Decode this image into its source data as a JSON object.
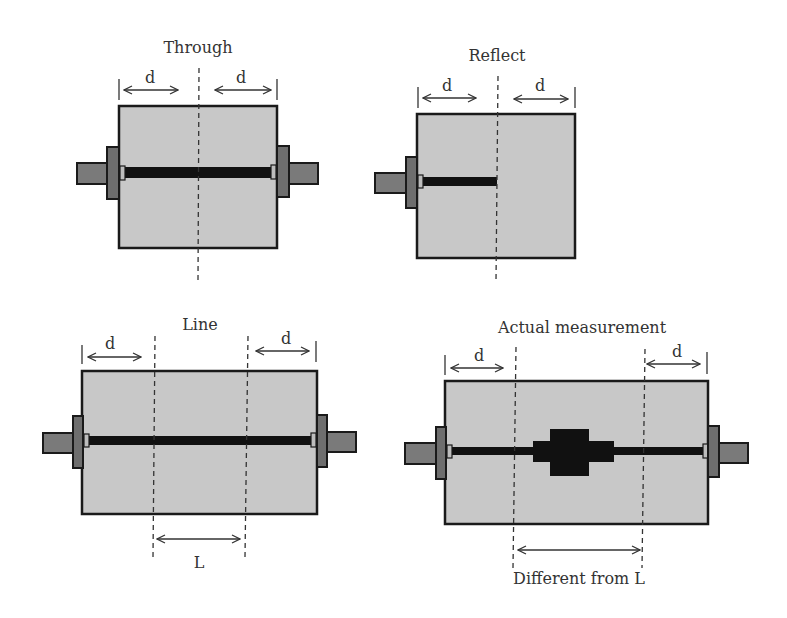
{
  "diagram": {
    "panels": {
      "through": {
        "title": "Through",
        "left_dim": "d",
        "right_dim": "d"
      },
      "reflect": {
        "title": "Reflect",
        "left_dim": "d",
        "right_dim": "d"
      },
      "line": {
        "title": "Line",
        "left_dim": "d",
        "right_dim": "d",
        "bottom_dim": "L"
      },
      "actual": {
        "title": "Actual measurement",
        "left_dim": "d",
        "right_dim": "d",
        "bottom_dim": "Different from L"
      }
    },
    "colors": {
      "substrate": "#c8c8c8",
      "connector_pin": "#7a7a7a",
      "connector_flange": "#6e6e6e",
      "trace": "#111111",
      "outline": "#1a1a1a"
    }
  }
}
